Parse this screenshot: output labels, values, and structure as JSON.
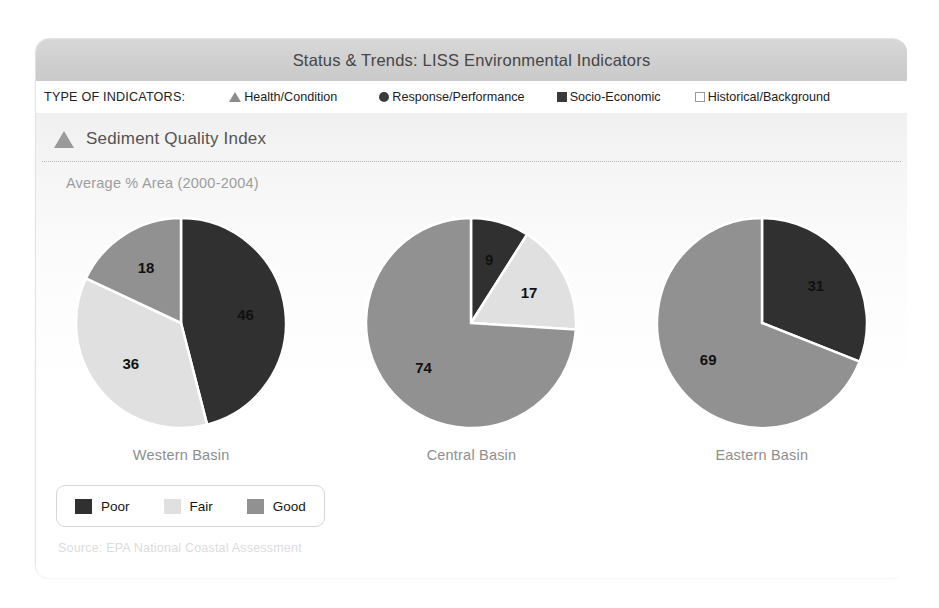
{
  "header": {
    "title": "Status & Trends: LISS Environmental Indicators",
    "indicator_caption": "TYPE OF INDICATORS:",
    "indicator_types": [
      {
        "label": "Health/Condition",
        "marker": "triangle-icon",
        "color": "#8c8c8c"
      },
      {
        "label": "Response/Performance",
        "marker": "circle-icon",
        "color": "#3a3a3a"
      },
      {
        "label": "Socio-Economic",
        "marker": "square-filled-icon",
        "color": "#3a3a3a"
      },
      {
        "label": "Historical/Background",
        "marker": "square-open-icon",
        "color": "#ffffff"
      }
    ]
  },
  "section": {
    "title": "Sediment Quality Index",
    "marker": "triangle-icon",
    "subtitle": "Average % Area (2000-2004)"
  },
  "legend": {
    "entries": [
      {
        "label": "Poor",
        "color": "#303030"
      },
      {
        "label": "Fair",
        "color": "#e0e0e0"
      },
      {
        "label": "Good",
        "color": "#919191"
      }
    ]
  },
  "source": "Source: EPA National Coastal Assessment",
  "colors": {
    "poor": "#303030",
    "fair": "#e0e0e0",
    "good": "#919191",
    "band": "#d2d2d2",
    "panel": "#f4f4f4",
    "slice_border": "#ffffff"
  },
  "chart_data": [
    {
      "type": "pie",
      "title": "Western Basin",
      "subtitle": "Average % Area (2000-2004)",
      "categories": [
        "Poor",
        "Fair",
        "Good"
      ],
      "values": [
        46,
        36,
        18
      ],
      "colors": [
        "#303030",
        "#e0e0e0",
        "#919191"
      ],
      "labels": [
        "46",
        "36",
        "18"
      ],
      "label_colors": [
        "#ffffff",
        "#111111",
        "#111111"
      ],
      "start_angle": 0,
      "direction": "clockwise",
      "units": "percent area",
      "legend_position": "bottom"
    },
    {
      "type": "pie",
      "title": "Central Basin",
      "subtitle": "Average % Area (2000-2004)",
      "categories": [
        "Poor",
        "Fair",
        "Good"
      ],
      "values": [
        9,
        17,
        74
      ],
      "colors": [
        "#303030",
        "#e0e0e0",
        "#919191"
      ],
      "labels": [
        "9",
        "17",
        "74"
      ],
      "label_colors": [
        "#ffffff",
        "#111111",
        "#111111"
      ],
      "start_angle": 0,
      "direction": "clockwise",
      "units": "percent area",
      "legend_position": "bottom"
    },
    {
      "type": "pie",
      "title": "Eastern Basin",
      "subtitle": "Average % Area (2000-2004)",
      "categories": [
        "Poor",
        "Fair",
        "Good"
      ],
      "values": [
        31,
        0,
        69
      ],
      "colors": [
        "#303030",
        "#e0e0e0",
        "#919191"
      ],
      "labels": [
        "31",
        "",
        "69"
      ],
      "label_colors": [
        "#ffffff",
        "#111111",
        "#111111"
      ],
      "start_angle": 0,
      "direction": "clockwise",
      "units": "percent area",
      "legend_position": "bottom"
    }
  ]
}
